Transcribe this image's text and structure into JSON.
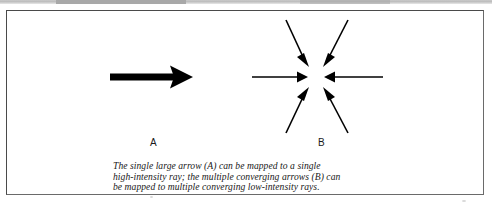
{
  "figure": {
    "labels": [
      {
        "id": "A",
        "text": "A"
      },
      {
        "id": "B",
        "text": "B"
      }
    ],
    "caption_lines": [
      "The single large arrow (A) can be mapped to a single",
      "high-intensity ray; the multiple converging arrows (B) can",
      "be mapped to multiple converging low-intensity rays."
    ],
    "caption_full": "The single large arrow (A) can be mapped to a single high-intensity ray; the multiple converging arrows (B) can be mapped to multiple converging low-intensity rays."
  },
  "colors": {
    "ink": "#000000",
    "frame": "#4a4a4a",
    "page": "#ffffff",
    "scan_band": "#bdbdbd"
  },
  "diagram_data": {
    "type": "arrow-diagram",
    "panels": [
      {
        "id": "A",
        "label": "A",
        "description": "single large thick arrow pointing right",
        "arrow_count": 1,
        "arrows": [
          {
            "name": "large-right-arrow",
            "from": [
              110,
              77
            ],
            "to": [
              193,
              77
            ],
            "weight": "thick"
          }
        ]
      },
      {
        "id": "B",
        "label": "B",
        "description": "six thin arrows converging on a common point",
        "arrow_count": 6,
        "convergence_point": [
          316,
          77
        ],
        "arrows": [
          {
            "name": "converging-arrow-left",
            "from": [
              252,
              77
            ],
            "to": [
              307,
              77
            ],
            "weight": "thin"
          },
          {
            "name": "converging-arrow-right",
            "from": [
              383,
              77
            ],
            "to": [
              326,
              77
            ],
            "weight": "thin"
          },
          {
            "name": "converging-arrow-upper-left",
            "from": [
              286,
              20
            ],
            "to": [
              308,
              66
            ],
            "weight": "thin"
          },
          {
            "name": "converging-arrow-upper-right",
            "from": [
              348,
              20
            ],
            "to": [
              325,
              66
            ],
            "weight": "thin"
          },
          {
            "name": "converging-arrow-lower-left",
            "from": [
              286,
              133
            ],
            "to": [
              308,
              89
            ],
            "weight": "thin"
          },
          {
            "name": "converging-arrow-lower-right",
            "from": [
              348,
              133
            ],
            "to": [
              325,
              89
            ],
            "weight": "thin"
          }
        ]
      }
    ]
  }
}
